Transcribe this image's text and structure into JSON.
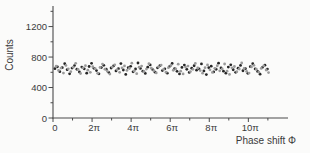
{
  "figure": {
    "background": "#fbfbfa",
    "axis_color": "#4a4a4a",
    "text_color": "#3a3a3a"
  },
  "chart_data": {
    "type": "scatter",
    "title": "",
    "xlabel": "Phase shift Φ",
    "ylabel": "Counts",
    "x_unit": "pi",
    "xlim_pi": [
      0,
      12.03
    ],
    "ylim": [
      0,
      1470
    ],
    "grid": false,
    "legend": null,
    "x_major_ticks_pi": [
      0,
      2,
      4,
      6,
      8,
      10
    ],
    "x_major_tick_labels": [
      "0",
      "2π",
      "4π",
      "6π",
      "8π",
      "10π"
    ],
    "x_minor_ticks_pi": [
      1,
      3,
      5,
      7,
      9,
      11
    ],
    "y_major_ticks": [
      0,
      400,
      800,
      1200
    ],
    "y_major_tick_labels": [
      "0",
      "400",
      "800",
      "1200"
    ],
    "y_minor_ticks": [
      200,
      600,
      1000,
      1400
    ],
    "series": [
      {
        "name": "counts-dark",
        "color": "#262626",
        "marker_radius": 1.4,
        "x_start_pi": 0.1,
        "x_step_pi": 0.125,
        "values": [
          648,
          672,
          608,
          660,
          712,
          634,
          580,
          655,
          688,
          640,
          604,
          668,
          645,
          588,
          676,
          718,
          652,
          622,
          580,
          662,
          692,
          641,
          600,
          656,
          684,
          618,
          648,
          714,
          630,
          572,
          660,
          678,
          606,
          643,
          722,
          651,
          615,
          585,
          667,
          696,
          636,
          602,
          659,
          688,
          622,
          645,
          588,
          678,
          716,
          649,
          612,
          578,
          664,
          694,
          639,
          598,
          653,
          686,
          628,
          646,
          710,
          618,
          570,
          661,
          680,
          605,
          640,
          720,
          657,
          614,
          588,
          669,
          698,
          633,
          600,
          654,
          690,
          620,
          647,
          586,
          674,
          713,
          644,
          610,
          575,
          665,
          693,
          642
        ]
      },
      {
        "name": "counts-gray",
        "color": "#9a9a9a",
        "marker_radius": 1.4,
        "x_start_pi": 0.16,
        "x_step_pi": 0.125,
        "values": [
          680,
          624,
          655,
          590,
          690,
          646,
          608,
          667,
          718,
          638,
          584,
          658,
          687,
          628,
          600,
          674,
          649,
          586,
          663,
          708,
          641,
          612,
          576,
          669,
          698,
          635,
          599,
          657,
          684,
          625,
          650,
          720,
          617,
          582,
          666,
          682,
          613,
          642,
          712,
          653,
          621,
          592,
          671,
          695,
          637,
          602,
          661,
          689,
          627,
          644,
          706,
          615,
          578,
          668,
          681,
          609,
          639,
          716,
          656,
          623,
          588,
          660,
          697,
          632,
          598,
          652,
          686,
          619,
          645,
          709,
          614,
          572,
          659,
          676,
          607,
          643,
          722,
          650,
          611,
          589,
          670,
          691,
          640,
          601,
          651,
          683,
          630,
          596
        ]
      }
    ]
  }
}
